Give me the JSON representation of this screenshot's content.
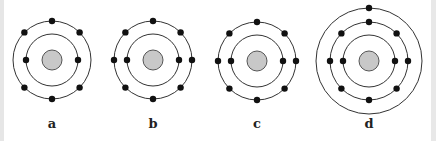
{
  "colors": {
    "ring": "#333333",
    "electron": "#111111",
    "nucleus_fill": "#c8c8c8",
    "nucleus_stroke": "#555555",
    "border": "#e6e6e6"
  },
  "atoms": [
    {
      "label": "a",
      "cx": 52,
      "cy": 60,
      "nucleus_r": 10,
      "shells": [
        {
          "r": 26,
          "electrons": 2,
          "angles": [
            180,
            0
          ]
        },
        {
          "r": 39,
          "electrons": 6,
          "angles": [
            -90,
            -135,
            -45,
            135,
            45,
            90
          ]
        }
      ]
    },
    {
      "label": "b",
      "cx": 153,
      "cy": 60,
      "nucleus_r": 10,
      "shells": [
        {
          "r": 26,
          "electrons": 2,
          "angles": [
            180,
            0
          ]
        },
        {
          "r": 39,
          "electrons": 8,
          "angles": [
            -90,
            -135,
            -45,
            180,
            0,
            135,
            45,
            90
          ]
        }
      ]
    },
    {
      "label": "c",
      "cx": 257,
      "cy": 61,
      "nucleus_r": 10,
      "shells": [
        {
          "r": 26,
          "electrons": 2,
          "angles": [
            180,
            0
          ]
        },
        {
          "r": 39,
          "electrons": 8,
          "angles": [
            -90,
            -135,
            -45,
            180,
            0,
            135,
            45,
            90
          ]
        }
      ]
    },
    {
      "label": "d",
      "cx": 369,
      "cy": 61,
      "nucleus_r": 10,
      "shells": [
        {
          "r": 26,
          "electrons": 2,
          "angles": [
            180,
            0
          ]
        },
        {
          "r": 39,
          "electrons": 8,
          "angles": [
            -90,
            -135,
            -45,
            180,
            0,
            135,
            45,
            90
          ]
        },
        {
          "r": 53,
          "electrons": 1,
          "angles": [
            -90
          ]
        }
      ]
    }
  ]
}
